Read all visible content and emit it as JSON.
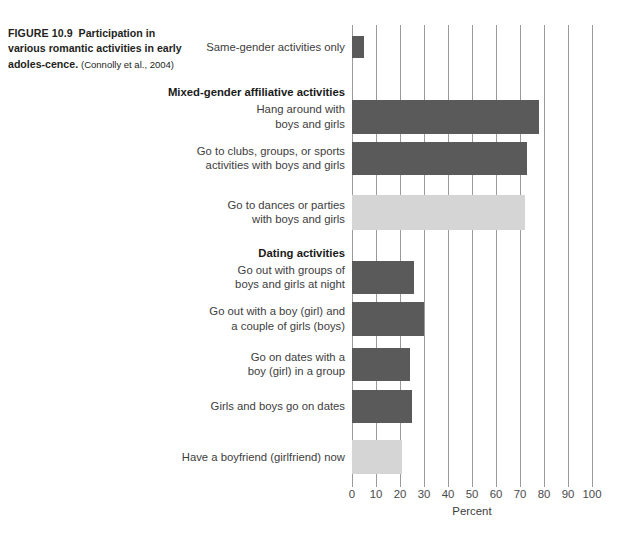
{
  "caption": {
    "figure_number": "FIGURE 10.9",
    "lead": "Participation in various romantic activities in early adoles-cence.",
    "text": "Participation in various romantic activities in early adoles-",
    "text_cont": "cence.",
    "citation": "(Connolly et al., 2004)"
  },
  "chart_data": {
    "type": "bar",
    "orientation": "horizontal",
    "title": "",
    "xlabel": "Percent",
    "ylabel": "",
    "xlim": [
      0,
      100
    ],
    "xticks": [
      0,
      10,
      20,
      30,
      40,
      50,
      60,
      70,
      80,
      90,
      100
    ],
    "xtick_labels": [
      "0",
      "10",
      "20",
      "30",
      "40",
      "50",
      "60",
      "70",
      "80",
      "90",
      "100"
    ],
    "grid": "vertical",
    "legend": "none",
    "colors": {
      "bar_dark": "#5a5a5a",
      "bar_light": "#d5d5d5",
      "gridline": "#9a9a9a",
      "label_text": "#3d3d3d"
    },
    "categories": [
      "Same-gender activities only",
      "Hang around with boys and girls",
      "Go to clubs, groups, or sports activities with boys and girls",
      "Go to dances or parties with boys and girls",
      "Go out with groups of boys and girls at night",
      "Go out with a boy (girl) and a couple of girls (boys)",
      "Go on dates with a boy (girl) in a group",
      "Girls and boys go on dates",
      "Have a boyfriend (girlfriend) now"
    ],
    "values": [
      5,
      78,
      73,
      72,
      26,
      30,
      24,
      25,
      21
    ],
    "section_headers": [
      "Mixed-gender affiliative activities",
      "Dating activities"
    ]
  },
  "bars": [
    {
      "label": "Same-gender activities only",
      "label_lines": "Same-gender activities only",
      "value": 5,
      "shade": "dark",
      "top": 36,
      "height": 22
    },
    {
      "label": "Hang around with boys and girls",
      "label_lines": "Hang around with\nboys and girls",
      "value": 78,
      "shade": "dark",
      "top": 100,
      "height": 34
    },
    {
      "label": "Go to clubs, groups, or sports activities with boys and girls",
      "label_lines": "Go to clubs, groups, or sports\nactivities with boys and girls",
      "value": 73,
      "shade": "dark",
      "top": 142,
      "height": 33
    },
    {
      "label": "Go to dances or parties with boys and girls",
      "label_lines": "Go to dances or parties\nwith boys and girls",
      "value": 72,
      "shade": "light",
      "top": 195,
      "height": 35
    },
    {
      "label": "Go out with groups of boys and girls at night",
      "label_lines": "Go out with groups of\nboys and girls at night",
      "value": 26,
      "shade": "dark",
      "top": 261,
      "height": 33
    },
    {
      "label": "Go out with a boy (girl) and a couple of girls (boys)",
      "label_lines": "Go out with a boy (girl) and\na couple of girls (boys)",
      "value": 30,
      "shade": "dark",
      "top": 302,
      "height": 34
    },
    {
      "label": "Go on dates with a boy (girl) in a group",
      "label_lines": "Go on dates with a\nboy (girl) in a group",
      "value": 24,
      "shade": "dark",
      "top": 348,
      "height": 33
    },
    {
      "label": "Girls and boys go on dates",
      "label_lines": "Girls and boys go on dates",
      "value": 25,
      "shade": "dark",
      "top": 390,
      "height": 33
    },
    {
      "label": "Have a boyfriend (girlfriend) now",
      "label_lines": "Have a boyfriend (girlfriend) now",
      "value": 21,
      "shade": "light",
      "top": 440,
      "height": 34
    }
  ],
  "sections": [
    {
      "label": "Mixed-gender affiliative activities",
      "top": 85
    },
    {
      "label": "Dating activities",
      "top": 246
    }
  ],
  "axis": {
    "title": "Percent",
    "ticks": [
      "0",
      "10",
      "20",
      "30",
      "40",
      "50",
      "60",
      "70",
      "80",
      "90",
      "100"
    ]
  }
}
